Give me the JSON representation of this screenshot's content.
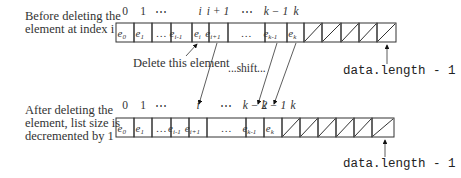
{
  "top": {
    "caption": "Before deleting the\nelement at index i",
    "indices": [
      {
        "label": "0",
        "x": 125,
        "italic": false
      },
      {
        "label": "1",
        "x": 143,
        "italic": false
      },
      {
        "label": "⋯",
        "x": 161,
        "italic": false
      },
      {
        "label": "i",
        "x": 200,
        "italic": true
      },
      {
        "label": "i + 1",
        "x": 218,
        "italic": true
      },
      {
        "label": "⋯",
        "x": 247,
        "italic": false
      },
      {
        "label": "k − 1",
        "x": 276,
        "italic": true
      },
      {
        "label": "k",
        "x": 296,
        "italic": true
      }
    ],
    "cells": [
      {
        "e": "e",
        "sub": "0",
        "x0": 116,
        "x1": 134
      },
      {
        "e": "e",
        "sub": "1",
        "x0": 134,
        "x1": 152
      },
      {
        "e": "…",
        "sub": "",
        "x0": 152,
        "x1": 171
      },
      {
        "e": "e",
        "sub": "i-1",
        "x0": 171,
        "x1": 192
      },
      {
        "e": "e",
        "sub": "i",
        "x0": 192,
        "x1": 209
      },
      {
        "e": "e",
        "sub": "i+1",
        "x0": 209,
        "x1": 228
      },
      {
        "e": "…",
        "sub": "",
        "x0": 228,
        "x1": 265
      },
      {
        "e": "e",
        "sub": "k-1",
        "x0": 265,
        "x1": 287
      },
      {
        "e": "e",
        "sub": "k",
        "x0": 287,
        "x1": 304
      }
    ],
    "empty_cells": [
      [
        304,
        322
      ],
      [
        322,
        341
      ],
      [
        341,
        359
      ],
      [
        359,
        377
      ],
      [
        377,
        396
      ]
    ],
    "y0": 23,
    "y1": 42,
    "length_label": "data.length - 1",
    "delete_label": "Delete this element",
    "shift_label": "...shift..."
  },
  "bottom": {
    "caption": "After deleting the\nelement, list size is\ndecremented by 1",
    "indices": [
      {
        "label": "0",
        "x": 125,
        "italic": false
      },
      {
        "label": "1",
        "x": 143,
        "italic": false
      },
      {
        "label": "⋯",
        "x": 161,
        "italic": false
      },
      {
        "label": "i",
        "x": 198,
        "italic": true
      },
      {
        "label": "⋯",
        "x": 226,
        "italic": false
      },
      {
        "label": "k − 2",
        "x": 255,
        "italic": true
      },
      {
        "label": "k − 1",
        "x": 274,
        "italic": true
      },
      {
        "label": "k",
        "x": 293,
        "italic": true
      }
    ],
    "cells": [
      {
        "e": "e",
        "sub": "0",
        "x0": 116,
        "x1": 134
      },
      {
        "e": "e",
        "sub": "1",
        "x0": 134,
        "x1": 152
      },
      {
        "e": "…",
        "sub": "",
        "x0": 152,
        "x1": 171
      },
      {
        "e": "e",
        "sub": "i-1",
        "x0": 171,
        "x1": 189
      },
      {
        "e": "e",
        "sub": "i+1",
        "x0": 189,
        "x1": 207
      },
      {
        "e": "…",
        "sub": "",
        "x0": 207,
        "x1": 246
      },
      {
        "e": "e",
        "sub": "k-1",
        "x0": 246,
        "x1": 264
      },
      {
        "e": "e",
        "sub": "k",
        "x0": 264,
        "x1": 282
      }
    ],
    "empty_cells": [
      [
        282,
        300
      ],
      [
        300,
        318
      ],
      [
        318,
        336
      ],
      [
        336,
        354
      ],
      [
        354,
        372
      ],
      [
        372,
        394
      ]
    ],
    "y0": 118,
    "y1": 137,
    "length_label": "data.length - 1"
  },
  "arrows": [
    {
      "x1": 186,
      "y1": 56,
      "x2": 197,
      "y2": 44
    },
    {
      "x1": 217,
      "y1": 43,
      "x2": 199,
      "y2": 104
    },
    {
      "x1": 277,
      "y1": 43,
      "x2": 258,
      "y2": 104
    },
    {
      "x1": 296,
      "y1": 43,
      "x2": 274,
      "y2": 104
    },
    {
      "x1": 387,
      "y1": 64,
      "x2": 387,
      "y2": 45
    },
    {
      "x1": 385,
      "y1": 157,
      "x2": 385,
      "y2": 140
    }
  ]
}
